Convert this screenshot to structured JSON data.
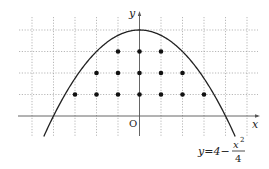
{
  "diagram": {
    "type": "function_plot_with_lattice_points",
    "function": "y = 4 - x^2/4",
    "labels": {
      "x_axis": "x",
      "y_axis": "y",
      "origin": "O",
      "equation_lhs": "y=4−",
      "equation_num": "x",
      "equation_exp": "2",
      "equation_den": "4"
    },
    "grid": {
      "x_range": [
        -5,
        5
      ],
      "y_range": [
        -1,
        4
      ],
      "unit": 1,
      "style": "dotted"
    },
    "lattice_points": [
      {
        "x": -3,
        "y": 1
      },
      {
        "x": -2,
        "y": 1
      },
      {
        "x": -1,
        "y": 1
      },
      {
        "x": 0,
        "y": 1
      },
      {
        "x": 1,
        "y": 1
      },
      {
        "x": 2,
        "y": 1
      },
      {
        "x": 3,
        "y": 1
      },
      {
        "x": -2,
        "y": 2
      },
      {
        "x": -1,
        "y": 2
      },
      {
        "x": 0,
        "y": 2
      },
      {
        "x": 1,
        "y": 2
      },
      {
        "x": 2,
        "y": 2
      },
      {
        "x": -1,
        "y": 3
      },
      {
        "x": 0,
        "y": 3
      },
      {
        "x": 1,
        "y": 3
      }
    ],
    "colors": {
      "grid": "#9a9a9a",
      "axis": "#555555",
      "curve": "#222222",
      "point": "#111111"
    }
  }
}
